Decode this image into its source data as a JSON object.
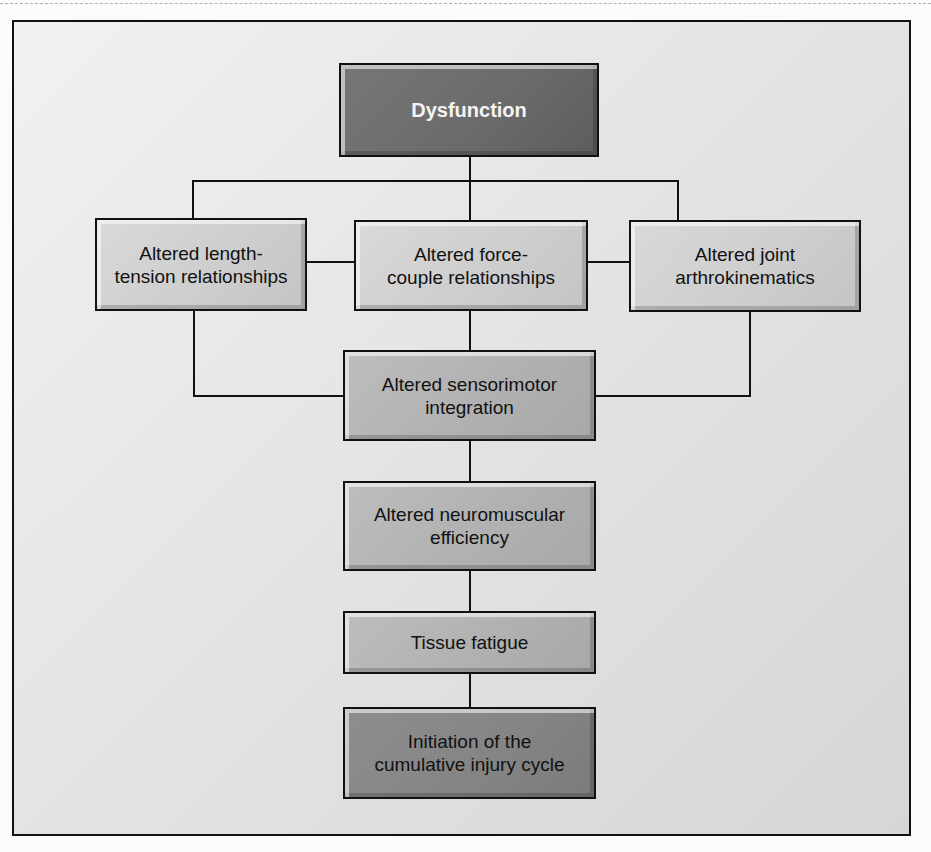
{
  "diagram": {
    "type": "flowchart",
    "nodes": {
      "dysfunction": "Dysfunction",
      "length_tension": "Altered length-\ntension relationships",
      "force_couple": "Altered force-\ncouple relationships",
      "joint_arthro": "Altered joint\narthrokinematics",
      "sensorimotor": "Altered sensorimotor\nintegration",
      "neuromuscular": "Altered neuromuscular\nefficiency",
      "tissue_fatigue": "Tissue fatigue",
      "initiation": "Initiation of the\ncumulative injury cycle"
    },
    "edges": [
      [
        "Dysfunction",
        "Altered length-tension relationships"
      ],
      [
        "Dysfunction",
        "Altered force-couple relationships"
      ],
      [
        "Dysfunction",
        "Altered joint arthrokinematics"
      ],
      [
        "Altered length-tension relationships",
        "Altered force-couple relationships"
      ],
      [
        "Altered force-couple relationships",
        "Altered joint arthrokinematics"
      ],
      [
        "Altered length-tension relationships",
        "Altered sensorimotor integration"
      ],
      [
        "Altered force-couple relationships",
        "Altered sensorimotor integration"
      ],
      [
        "Altered joint arthrokinematics",
        "Altered sensorimotor integration"
      ],
      [
        "Altered sensorimotor integration",
        "Altered neuromuscular efficiency"
      ],
      [
        "Altered neuromuscular efficiency",
        "Tissue fatigue"
      ],
      [
        "Tissue fatigue",
        "Initiation of the cumulative injury cycle"
      ]
    ],
    "colors": {
      "frame_border": "#111111",
      "frame_bg": "#e6e6e6",
      "top_node_bg": "#6a6a6a",
      "top_node_text": "#f4f4f4",
      "light_node_bg": "#cdcdcd",
      "mid_node_bg": "#b0b0b0",
      "bottom_node_bg": "#848484"
    }
  }
}
